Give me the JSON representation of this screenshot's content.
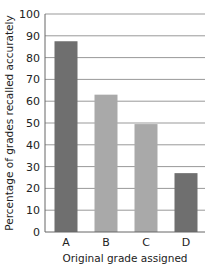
{
  "chart_data": {
    "type": "bar",
    "title": "",
    "categories": [
      "A",
      "B",
      "C",
      "D"
    ],
    "values": [
      87.5,
      63,
      49.5,
      27
    ],
    "xlabel": "Original grade assigned",
    "ylabel": "Percentage of grades recalled accurately",
    "ylim": [
      0,
      100
    ],
    "yticks": [
      0,
      10,
      20,
      30,
      40,
      50,
      60,
      70,
      80,
      90,
      100
    ],
    "grid": true,
    "bar_colors": [
      "#6f6f6f",
      "#a9a9a9",
      "#a9a9a9",
      "#6f6f6f"
    ]
  }
}
